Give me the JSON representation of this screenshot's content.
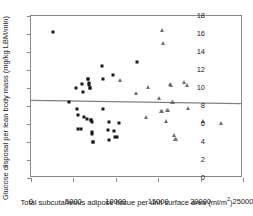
{
  "chart_data": {
    "type": "scatter",
    "title": "",
    "xlabel": "Total subcutaneous adipose tissue per unit surface area (ml/m2)",
    "xlabel_main": "Total subcutaneous adipose tissue per unit surface area (ml/m",
    "xlabel_sup": "2",
    "xlabel_tail": ")",
    "ylabel": "Glucose disposal per lean body mass (mg/kg LBM/min)",
    "xlim": [
      0,
      25000
    ],
    "ylim": [
      0,
      18
    ],
    "xticks": [
      0,
      5000,
      10000,
      15000,
      20000,
      25000
    ],
    "xticklabels": [
      "0",
      "5000",
      "10000",
      "15000",
      "20000",
      "25000"
    ],
    "yticks": [
      0,
      2,
      4,
      6,
      8,
      10,
      12,
      14,
      16,
      18
    ],
    "yticklabels": [
      "0",
      "2",
      "4",
      "6",
      "8",
      "10",
      "12",
      "14",
      "16",
      "18"
    ],
    "grid": false,
    "legend": "none",
    "series": [
      {
        "name": "squares",
        "marker": "square",
        "color": "#1a1a1a",
        "points": [
          [
            2550,
            16.2
          ],
          [
            4500,
            8.5
          ],
          [
            5300,
            9.95
          ],
          [
            5400,
            7.65
          ],
          [
            5500,
            6.95
          ],
          [
            5600,
            5.45
          ],
          [
            5900,
            5.45
          ],
          [
            6000,
            10.45
          ],
          [
            6150,
            9.6
          ],
          [
            6250,
            6.75
          ],
          [
            6550,
            6.6
          ],
          [
            6700,
            10.95
          ],
          [
            6750,
            11.05
          ],
          [
            6800,
            10.55
          ],
          [
            6850,
            10.3
          ],
          [
            6900,
            9.95
          ],
          [
            7000,
            10.0
          ],
          [
            7050,
            6.5
          ],
          [
            7100,
            6.4
          ],
          [
            7150,
            6.2
          ],
          [
            7200,
            5.1
          ],
          [
            7250,
            4.85
          ],
          [
            7300,
            4.0
          ],
          [
            7350,
            3.95
          ],
          [
            8350,
            12.5
          ],
          [
            8450,
            10.95
          ],
          [
            8500,
            7.65
          ],
          [
            9100,
            5.35
          ],
          [
            9200,
            4.25
          ],
          [
            9250,
            6.25
          ],
          [
            9700,
            11.5
          ],
          [
            9800,
            5.25
          ],
          [
            9950,
            4.6
          ],
          [
            10200,
            4.6
          ],
          [
            10350,
            6.1
          ],
          [
            12450,
            12.9
          ]
        ]
      },
      {
        "name": "triangles",
        "marker": "triangle",
        "color": "#707070",
        "points": [
          [
            10550,
            10.85
          ],
          [
            12400,
            9.45
          ],
          [
            13600,
            6.8
          ],
          [
            13850,
            10.1
          ],
          [
            15050,
            8.85
          ],
          [
            15300,
            7.45
          ],
          [
            15450,
            16.5
          ],
          [
            15500,
            7.4
          ],
          [
            15550,
            15.0
          ],
          [
            15900,
            6.3
          ],
          [
            16050,
            7.6
          ],
          [
            16200,
            7.55
          ],
          [
            16450,
            10.4
          ],
          [
            16500,
            10.3
          ],
          [
            16600,
            8.4
          ],
          [
            16700,
            8.45
          ],
          [
            16900,
            4.75
          ],
          [
            17000,
            4.35
          ],
          [
            17050,
            4.3
          ],
          [
            18050,
            10.7
          ],
          [
            18350,
            10.3
          ],
          [
            18500,
            7.8
          ],
          [
            20300,
            6.35
          ],
          [
            22400,
            6.1
          ]
        ]
      }
    ],
    "trendline": {
      "name": "regression-line",
      "color": "#808080",
      "x_start": 0,
      "y_start": 8.5,
      "x_end": 25000,
      "y_end": 8.15
    }
  }
}
